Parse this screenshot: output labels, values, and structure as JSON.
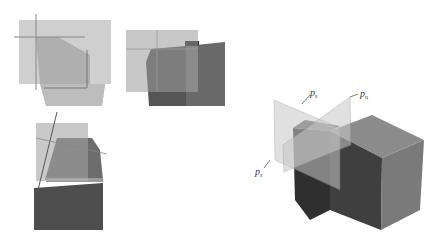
{
  "figure": {
    "panels": [
      {
        "id": "top-left",
        "description": "plane projection with cross-hair lines"
      },
      {
        "id": "top-middle",
        "description": "block behind translucent plane"
      },
      {
        "id": "bottom-left",
        "description": "side view with oblique line"
      },
      {
        "id": "right",
        "description": "3D block intersected by two planes"
      }
    ],
    "labels": {
      "upper_plane": {
        "base": "p",
        "sub": "s"
      },
      "right_plane": {
        "base": "p",
        "sub": "u"
      },
      "lower_plane": {
        "base": "p",
        "sub": "s"
      }
    },
    "colors": {
      "plane": "#c8c8c8",
      "block_dark": "#4a4a4a",
      "block_mid": "#6e6e6e",
      "block_light": "#8a8a8a",
      "line": "#707070"
    }
  }
}
